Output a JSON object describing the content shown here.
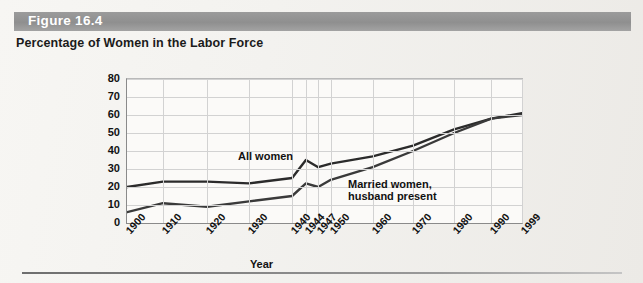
{
  "figure": {
    "number_label": "Figure 16.4",
    "title": "Percentage of Women in the Labor Force"
  },
  "chart_data": {
    "type": "line",
    "title": "Percentage of Women in the Labor Force",
    "xlabel": "Year",
    "ylabel": "",
    "ylim": [
      0,
      80
    ],
    "ytick_step": 10,
    "grid": true,
    "legend": "inline-labels",
    "categories": [
      "1900",
      "1910",
      "1920",
      "1930",
      "1940",
      "1944",
      "1947",
      "1950",
      "1960",
      "1970",
      "1980",
      "1990",
      "1999"
    ],
    "yticks": [
      "0",
      "10",
      "20",
      "30",
      "40",
      "50",
      "60",
      "70",
      "80"
    ],
    "series": [
      {
        "name": "All women",
        "color": "#2b2b2b",
        "values": [
          20,
          23,
          23,
          22,
          25,
          35,
          31,
          33,
          37,
          43,
          52,
          58,
          61
        ]
      },
      {
        "name": "Married women, husband present",
        "color": "#3a3a3a",
        "values": [
          6,
          11,
          9,
          12,
          15,
          22,
          20,
          24,
          31,
          40,
          50,
          58,
          60
        ]
      }
    ],
    "annotations": [
      {
        "text": "All women",
        "at": "1940"
      },
      {
        "text": "Married women,",
        "at": "1960"
      },
      {
        "text": "husband present",
        "at": "1960"
      }
    ]
  },
  "labels": {
    "series_all_women": "All women",
    "series_married_line1": "Married women,",
    "series_married_line2": "husband present",
    "axis_x_title": "Year"
  },
  "colors": {
    "band": "#949494",
    "line": "#2b2b2b",
    "grid": "#d2d2d2",
    "axis": "#8a8a8a",
    "page": "#f2f1ee"
  }
}
